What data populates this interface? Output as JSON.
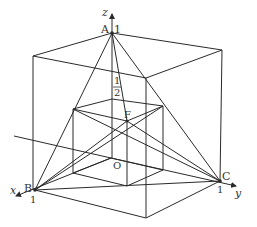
{
  "diagram": {
    "type": "3d-coordinate-cube",
    "axes": {
      "x": {
        "label": "x",
        "tick": "1"
      },
      "y": {
        "label": "y",
        "tick": "1"
      },
      "z": {
        "label": "z",
        "tick": "1",
        "half_tick_num": "1",
        "half_tick_den": "2"
      }
    },
    "points": {
      "A": {
        "label": "A"
      },
      "B": {
        "label": "B"
      },
      "C": {
        "label": "C"
      },
      "F": {
        "label": "F"
      },
      "O": {
        "label": "O"
      }
    },
    "colors": {
      "line": "#2a2a2a",
      "text": "#333333",
      "background": "#ffffff"
    }
  }
}
